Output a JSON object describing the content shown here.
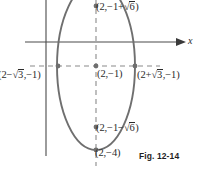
{
  "figure": {
    "caption": "Fig. 12-14",
    "axis_label_x": "x",
    "curve": "ellipse",
    "center": "(2,-1)",
    "labels": {
      "top_vertex": "(2,−1+√6)",
      "bottom_vertex": "(2,−1−√6)",
      "left_covertex": "(2−√3,−1)",
      "right_covertex": "(2+√3,√1)",
      "center_point": "(2,−1)",
      "lower_point": "(2,−4)"
    },
    "label_parts": {
      "top": {
        "pre": "(2,",
        "mid": "−1+",
        "radical": "√",
        "rad_arg": "6",
        "post": ")"
      },
      "bottom": {
        "pre": "(2,",
        "mid": "−1−",
        "radical": "√",
        "rad_arg": "6",
        "post": ")"
      },
      "left": {
        "pre": "(2−",
        "radical": "√",
        "rad_arg": "3",
        "post": ",−1)"
      },
      "right": {
        "pre": "(2+",
        "radical": "√",
        "rad_arg": "3",
        "post": ",−1)"
      },
      "center": {
        "text": "(2,−1)"
      },
      "lower": {
        "text": "(2,−4)"
      }
    },
    "colors": {
      "curve": "#6f6f6f",
      "axis": "#4a4a4a",
      "dash": "#8a8a8a",
      "point": "#6f6f6f",
      "text": "#2b2b2b"
    }
  }
}
